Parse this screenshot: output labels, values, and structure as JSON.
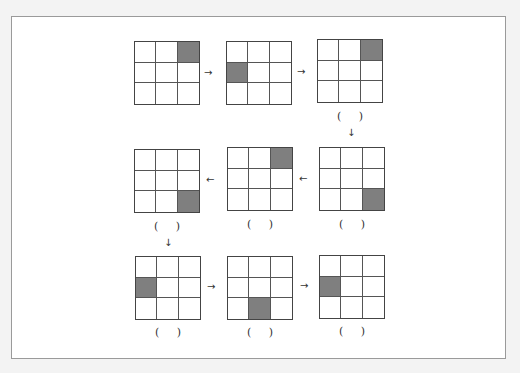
{
  "puzzle": {
    "shade_color": "#7f7f7f",
    "blank_label": "(     )",
    "rows": [
      {
        "direction": "right",
        "grids": [
          {
            "shaded": [
              0,
              0,
              1,
              0,
              0,
              0,
              0,
              0,
              0
            ],
            "show_blank": false
          },
          {
            "shaded": [
              0,
              0,
              0,
              1,
              0,
              0,
              0,
              0,
              0
            ],
            "show_blank": false
          },
          {
            "shaded": [
              0,
              0,
              1,
              0,
              0,
              0,
              0,
              0,
              0
            ],
            "show_blank": true
          }
        ],
        "arrows": [
          "→",
          "→"
        ],
        "down_arrow": "↓"
      },
      {
        "direction": "left",
        "grids": [
          {
            "shaded": [
              0,
              0,
              0,
              0,
              0,
              0,
              0,
              0,
              1
            ],
            "show_blank": true
          },
          {
            "shaded": [
              0,
              0,
              1,
              0,
              0,
              0,
              0,
              0,
              0
            ],
            "show_blank": true
          },
          {
            "shaded": [
              0,
              0,
              0,
              0,
              0,
              0,
              0,
              0,
              1
            ],
            "show_blank": true
          }
        ],
        "arrows": [
          "←",
          "←"
        ],
        "down_arrow": "↓"
      },
      {
        "direction": "right",
        "grids": [
          {
            "shaded": [
              0,
              0,
              0,
              1,
              0,
              0,
              0,
              0,
              0
            ],
            "show_blank": true
          },
          {
            "shaded": [
              0,
              0,
              0,
              0,
              0,
              0,
              0,
              1,
              0
            ],
            "show_blank": true
          },
          {
            "shaded": [
              0,
              0,
              0,
              1,
              0,
              0,
              0,
              0,
              0
            ],
            "show_blank": true
          }
        ],
        "arrows": [
          "→",
          "→"
        ]
      }
    ]
  }
}
